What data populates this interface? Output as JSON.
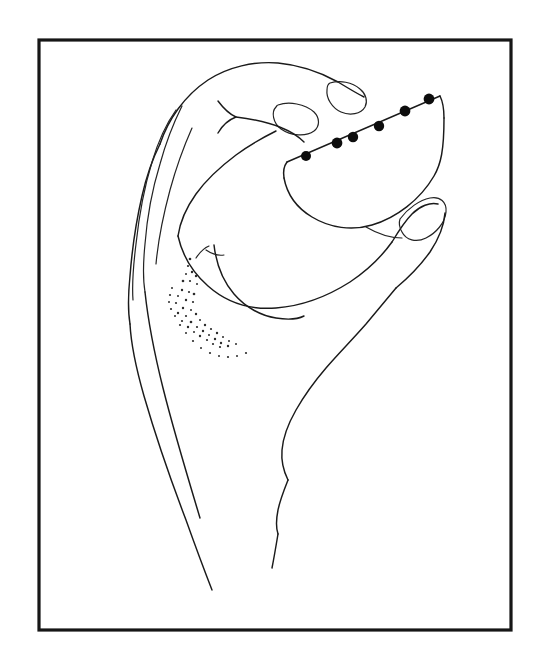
{
  "figure": {
    "title": "Hand holding a semicircular object with six marker dots",
    "style": "black-and-white line drawing",
    "background_color": "#ffffff",
    "ink_color": "#1a1a1a",
    "marker_color": "#0d0d0d",
    "frame": {
      "label": "rectangular border frame",
      "color": "#161616",
      "stroke_width_px": 3,
      "x": 39,
      "y": 40,
      "width": 472,
      "height": 590
    },
    "subjects": [
      {
        "name": "hand",
        "label": "Left hand in pinch grip, viewed from the side",
        "parts": [
          "index finger",
          "middle finger",
          "ring finger",
          "little finger",
          "thumb",
          "knuckles",
          "palm",
          "wrist",
          "forearm"
        ],
        "fingernails_visible": 3,
        "shading": "stippled dots near the thumb web"
      },
      {
        "name": "held-object",
        "label": "Semicircular dome-shaped object (flat edge up)",
        "orientation": "flat edge tilted upward to the right",
        "marker_dot_count": 6,
        "marker_dot_label": "black marker dots along the straight edge"
      }
    ],
    "marker_dots": [
      {
        "id": 1,
        "x": 306,
        "y": 156,
        "r": 5.0
      },
      {
        "id": 2,
        "x": 337,
        "y": 143,
        "r": 5.4
      },
      {
        "id": 3,
        "x": 353,
        "y": 137,
        "r": 5.2
      },
      {
        "id": 4,
        "x": 379,
        "y": 126,
        "r": 5.2
      },
      {
        "id": 5,
        "x": 405,
        "y": 111,
        "r": 5.4
      },
      {
        "id": 6,
        "x": 429,
        "y": 99,
        "r": 5.4
      }
    ],
    "stipple_dots": [
      {
        "x": 190,
        "y": 259,
        "r": 1.3
      },
      {
        "x": 188,
        "y": 266,
        "r": 1.1
      },
      {
        "x": 192,
        "y": 272,
        "r": 1.2
      },
      {
        "x": 186,
        "y": 274,
        "r": 1.0
      },
      {
        "x": 183,
        "y": 281,
        "r": 1.3
      },
      {
        "x": 190,
        "y": 281,
        "r": 1.1
      },
      {
        "x": 196,
        "y": 276,
        "r": 1.2
      },
      {
        "x": 197,
        "y": 284,
        "r": 1.0
      },
      {
        "x": 182,
        "y": 290,
        "r": 1.2
      },
      {
        "x": 189,
        "y": 292,
        "r": 1.1
      },
      {
        "x": 194,
        "y": 294,
        "r": 1.3
      },
      {
        "x": 178,
        "y": 296,
        "r": 1.0
      },
      {
        "x": 186,
        "y": 300,
        "r": 1.2
      },
      {
        "x": 193,
        "y": 302,
        "r": 1.1
      },
      {
        "x": 176,
        "y": 303,
        "r": 1.1
      },
      {
        "x": 183,
        "y": 308,
        "r": 1.2
      },
      {
        "x": 191,
        "y": 310,
        "r": 1.0
      },
      {
        "x": 178,
        "y": 313,
        "r": 1.2
      },
      {
        "x": 186,
        "y": 316,
        "r": 1.1
      },
      {
        "x": 196,
        "y": 314,
        "r": 1.2
      },
      {
        "x": 182,
        "y": 321,
        "r": 1.1
      },
      {
        "x": 191,
        "y": 322,
        "r": 1.3
      },
      {
        "x": 200,
        "y": 320,
        "r": 1.0
      },
      {
        "x": 188,
        "y": 327,
        "r": 1.2
      },
      {
        "x": 197,
        "y": 327,
        "r": 1.1
      },
      {
        "x": 205,
        "y": 325,
        "r": 1.2
      },
      {
        "x": 194,
        "y": 332,
        "r": 1.0
      },
      {
        "x": 203,
        "y": 331,
        "r": 1.2
      },
      {
        "x": 211,
        "y": 329,
        "r": 1.1
      },
      {
        "x": 200,
        "y": 336,
        "r": 1.2
      },
      {
        "x": 209,
        "y": 335,
        "r": 1.0
      },
      {
        "x": 217,
        "y": 333,
        "r": 1.2
      },
      {
        "x": 207,
        "y": 340,
        "r": 1.1
      },
      {
        "x": 215,
        "y": 339,
        "r": 1.2
      },
      {
        "x": 223,
        "y": 337,
        "r": 1.0
      },
      {
        "x": 213,
        "y": 344,
        "r": 1.1
      },
      {
        "x": 221,
        "y": 343,
        "r": 1.2
      },
      {
        "x": 229,
        "y": 341,
        "r": 1.0
      },
      {
        "x": 220,
        "y": 347,
        "r": 1.1
      },
      {
        "x": 228,
        "y": 346,
        "r": 1.2
      },
      {
        "x": 236,
        "y": 344,
        "r": 1.0
      },
      {
        "x": 172,
        "y": 288,
        "r": 1.0
      },
      {
        "x": 170,
        "y": 295,
        "r": 1.1
      },
      {
        "x": 169,
        "y": 302,
        "r": 1.0
      },
      {
        "x": 171,
        "y": 309,
        "r": 1.1
      },
      {
        "x": 175,
        "y": 316,
        "r": 1.0
      },
      {
        "x": 180,
        "y": 325,
        "r": 1.1
      },
      {
        "x": 186,
        "y": 333,
        "r": 1.0
      },
      {
        "x": 193,
        "y": 341,
        "r": 1.1
      },
      {
        "x": 201,
        "y": 348,
        "r": 1.0
      },
      {
        "x": 210,
        "y": 353,
        "r": 1.1
      },
      {
        "x": 219,
        "y": 356,
        "r": 1.0
      },
      {
        "x": 228,
        "y": 357,
        "r": 1.1
      },
      {
        "x": 237,
        "y": 356,
        "r": 1.0
      },
      {
        "x": 246,
        "y": 353,
        "r": 1.1
      }
    ]
  }
}
